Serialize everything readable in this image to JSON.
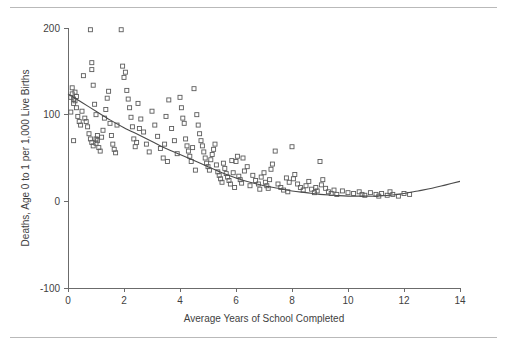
{
  "figure": {
    "background_color": "#ffffff",
    "rule_color": "#b9b9b9",
    "marker_color": "#5c5c5c",
    "curve_color": "#4a4a4a",
    "axis_color": "#6b6b6b"
  },
  "chart_data": {
    "type": "scatter",
    "title": "",
    "subtitle": "",
    "xlabel": "Average Years of School Completed",
    "ylabel": "Deaths, Age 0 to 1 per 1,000 Live Births",
    "xlim": [
      0,
      14
    ],
    "ylim": [
      -100,
      200
    ],
    "xticks": [
      0,
      2,
      4,
      6,
      8,
      10,
      12,
      14
    ],
    "xtick_labels": [
      "0",
      "2",
      "4",
      "6",
      "8",
      "10",
      "12",
      "14"
    ],
    "yticks": [
      -100,
      0,
      100,
      200
    ],
    "ytick_labels": [
      "-100",
      "0",
      "100",
      "200"
    ],
    "grid": false,
    "legend": false,
    "legend_position": "none",
    "marker_style": "open-square",
    "marker_size": 4,
    "annotations": [],
    "series": [
      {
        "name": "Countries",
        "type": "scatter",
        "points": [
          [
            0.1,
            120
          ],
          [
            0.15,
            124
          ],
          [
            0.2,
            118
          ],
          [
            0.25,
            126
          ],
          [
            0.2,
            113
          ],
          [
            0.3,
            108
          ],
          [
            0.1,
            103
          ],
          [
            0.35,
            98
          ],
          [
            0.4,
            92
          ],
          [
            0.15,
            131
          ],
          [
            0.3,
            121
          ],
          [
            0.25,
            116
          ],
          [
            0.45,
            88
          ],
          [
            0.2,
            70
          ],
          [
            0.5,
            104
          ],
          [
            0.55,
            145
          ],
          [
            0.8,
            198
          ],
          [
            0.85,
            160
          ],
          [
            0.85,
            152
          ],
          [
            0.9,
            134
          ],
          [
            0.95,
            112
          ],
          [
            1.0,
            100
          ],
          [
            0.7,
            86
          ],
          [
            0.75,
            78
          ],
          [
            0.8,
            72
          ],
          [
            0.85,
            68
          ],
          [
            0.9,
            64
          ],
          [
            1.0,
            67
          ],
          [
            1.05,
            70
          ],
          [
            1.1,
            62
          ],
          [
            1.15,
            58
          ],
          [
            1.2,
            74
          ],
          [
            1.25,
            82
          ],
          [
            1.3,
            96
          ],
          [
            1.35,
            106
          ],
          [
            1.4,
            119
          ],
          [
            1.45,
            127
          ],
          [
            1.5,
            90
          ],
          [
            1.55,
            76
          ],
          [
            1.6,
            66
          ],
          [
            1.65,
            60
          ],
          [
            1.7,
            56
          ],
          [
            1.9,
            198
          ],
          [
            1.95,
            156
          ],
          [
            2.0,
            143
          ],
          [
            2.05,
            149
          ],
          [
            2.1,
            128
          ],
          [
            2.15,
            118
          ],
          [
            2.2,
            108
          ],
          [
            2.25,
            97
          ],
          [
            2.3,
            86
          ],
          [
            2.35,
            72
          ],
          [
            2.4,
            63
          ],
          [
            2.5,
            113
          ],
          [
            2.6,
            95
          ],
          [
            2.7,
            80
          ],
          [
            2.8,
            66
          ],
          [
            2.9,
            57
          ],
          [
            3.0,
            104
          ],
          [
            3.1,
            88
          ],
          [
            3.2,
            75
          ],
          [
            3.3,
            61
          ],
          [
            3.4,
            50
          ],
          [
            3.5,
            98
          ],
          [
            3.6,
            117
          ],
          [
            3.7,
            84
          ],
          [
            3.8,
            70
          ],
          [
            3.9,
            55
          ],
          [
            4.0,
            120
          ],
          [
            4.05,
            108
          ],
          [
            4.1,
            96
          ],
          [
            4.15,
            90
          ],
          [
            4.2,
            72
          ],
          [
            4.25,
            64
          ],
          [
            4.3,
            58
          ],
          [
            4.35,
            52
          ],
          [
            4.4,
            46
          ],
          [
            4.5,
            130
          ],
          [
            4.6,
            100
          ],
          [
            4.65,
            88
          ],
          [
            4.7,
            78
          ],
          [
            4.75,
            70
          ],
          [
            4.8,
            64
          ],
          [
            4.85,
            57
          ],
          [
            4.9,
            50
          ],
          [
            4.95,
            44
          ],
          [
            5.0,
            40
          ],
          [
            5.05,
            36
          ],
          [
            5.1,
            48
          ],
          [
            5.15,
            54
          ],
          [
            5.2,
            60
          ],
          [
            5.25,
            66
          ],
          [
            5.3,
            42
          ],
          [
            5.35,
            34
          ],
          [
            5.4,
            30
          ],
          [
            5.45,
            26
          ],
          [
            5.5,
            22
          ],
          [
            5.55,
            44
          ],
          [
            5.6,
            38
          ],
          [
            5.65,
            32
          ],
          [
            5.7,
            28
          ],
          [
            5.75,
            24
          ],
          [
            5.8,
            20
          ],
          [
            5.9,
            33
          ],
          [
            6.0,
            46
          ],
          [
            6.05,
            52
          ],
          [
            6.1,
            29
          ],
          [
            6.15,
            25
          ],
          [
            6.2,
            21
          ],
          [
            6.3,
            35
          ],
          [
            6.4,
            40
          ],
          [
            6.5,
            18
          ],
          [
            6.6,
            30
          ],
          [
            6.7,
            24
          ],
          [
            6.8,
            20
          ],
          [
            6.9,
            28
          ],
          [
            7.0,
            33
          ],
          [
            7.05,
            22
          ],
          [
            7.1,
            18
          ],
          [
            7.15,
            15
          ],
          [
            7.2,
            25
          ],
          [
            7.3,
            43
          ],
          [
            7.4,
            58
          ],
          [
            7.5,
            20
          ],
          [
            7.6,
            16
          ],
          [
            7.7,
            13
          ],
          [
            7.8,
            27
          ],
          [
            7.9,
            22
          ],
          [
            8.0,
            63
          ],
          [
            8.1,
            31
          ],
          [
            8.2,
            20
          ],
          [
            8.3,
            16
          ],
          [
            8.4,
            13
          ],
          [
            8.5,
            18
          ],
          [
            8.6,
            23
          ],
          [
            8.7,
            14
          ],
          [
            8.8,
            10
          ],
          [
            8.9,
            12
          ],
          [
            9.0,
            46
          ],
          [
            9.1,
            25
          ],
          [
            9.2,
            15
          ],
          [
            9.3,
            11
          ],
          [
            9.4,
            9
          ],
          [
            9.5,
            13
          ],
          [
            9.6,
            8
          ],
          [
            9.8,
            12
          ],
          [
            10.0,
            10
          ],
          [
            10.2,
            9
          ],
          [
            10.4,
            11
          ],
          [
            10.5,
            8
          ],
          [
            10.6,
            7
          ],
          [
            10.8,
            10
          ],
          [
            11.0,
            8
          ],
          [
            11.1,
            6
          ],
          [
            11.2,
            9
          ],
          [
            11.4,
            7
          ],
          [
            11.5,
            11
          ],
          [
            11.6,
            8
          ],
          [
            11.8,
            6
          ],
          [
            12.0,
            9
          ],
          [
            12.2,
            8
          ],
          [
            1.0,
            72
          ],
          [
            1.05,
            76
          ],
          [
            2.45,
            68
          ],
          [
            3.45,
            66
          ],
          [
            4.45,
            62
          ],
          [
            5.85,
            47
          ],
          [
            6.25,
            50
          ],
          [
            7.25,
            37
          ],
          [
            8.05,
            26
          ],
          [
            9.05,
            19
          ],
          [
            0.6,
            96
          ],
          [
            0.65,
            92
          ],
          [
            1.75,
            88
          ],
          [
            2.55,
            84
          ],
          [
            3.55,
            46
          ],
          [
            4.55,
            36
          ],
          [
            5.95,
            16
          ],
          [
            6.85,
            14
          ],
          [
            7.85,
            11
          ],
          [
            8.85,
            16
          ]
        ]
      }
    ],
    "fit_curve": {
      "name": "Lowess fit",
      "type": "line",
      "points": [
        [
          0.0,
          124
        ],
        [
          0.5,
          114
        ],
        [
          1.0,
          104
        ],
        [
          1.5,
          94
        ],
        [
          2.0,
          85
        ],
        [
          2.5,
          77
        ],
        [
          3.0,
          69
        ],
        [
          3.5,
          61
        ],
        [
          4.0,
          54
        ],
        [
          4.5,
          47
        ],
        [
          5.0,
          40
        ],
        [
          5.5,
          33
        ],
        [
          6.0,
          27
        ],
        [
          6.5,
          22
        ],
        [
          7.0,
          18
        ],
        [
          7.5,
          15
        ],
        [
          8.0,
          12
        ],
        [
          8.5,
          10
        ],
        [
          9.0,
          8
        ],
        [
          9.5,
          7
        ],
        [
          10.0,
          6
        ],
        [
          10.5,
          6
        ],
        [
          11.0,
          6
        ],
        [
          11.5,
          7
        ],
        [
          12.0,
          9
        ],
        [
          12.5,
          12
        ],
        [
          13.0,
          15
        ],
        [
          13.5,
          19
        ],
        [
          14.0,
          23
        ]
      ]
    }
  }
}
